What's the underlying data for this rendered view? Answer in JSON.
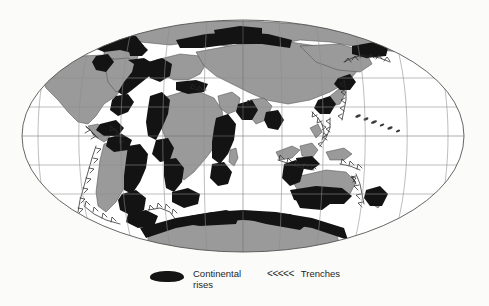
{
  "figure": {
    "background_color": "#fbfbf9",
    "projection": "elliptical (Mollweide-style) world projection"
  },
  "map": {
    "ocean_color": "#ffffff",
    "land_color": "#9a9a9a",
    "rise_color": "#141414",
    "graticule_color": "#8d8d8d",
    "outline_color": "#555555",
    "ellipse": {
      "cx": 243,
      "cy": 136,
      "rx": 221,
      "ry": 116
    },
    "graticule": {
      "parallels": [
        60,
        30,
        0,
        -30,
        -60
      ],
      "meridians": [
        -180,
        -150,
        -120,
        -90,
        -60,
        -30,
        0,
        30,
        60,
        90,
        120,
        150,
        180
      ],
      "spacing_degrees": 30
    }
  },
  "legend": {
    "items": [
      {
        "id": "continental-rises",
        "symbol": "black-blob",
        "label": "Continental\nrises"
      },
      {
        "id": "trenches",
        "symbol": "<<<<<",
        "label": "Trenches"
      }
    ],
    "rises_label": "Continental\nrises",
    "trenches_symbol": "<<<<<",
    "trenches_label": "Trenches"
  }
}
